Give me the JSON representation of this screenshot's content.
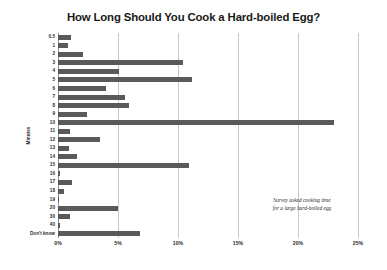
{
  "chart_data": {
    "type": "bar",
    "orientation": "horizontal",
    "title": "How Long Should You Cook a Hard-boiled Egg?",
    "xlabel": "",
    "ylabel": "Minutes",
    "categories": [
      "0.5",
      "1",
      "2",
      "3",
      "4",
      "5",
      "6",
      "7",
      "8",
      "9",
      "10",
      "11",
      "12",
      "13",
      "14",
      "15",
      "16",
      "17",
      "18",
      "19",
      "20",
      "30",
      "40",
      "Don't know"
    ],
    "values": [
      1.1,
      0.8,
      2.1,
      10.4,
      5.1,
      11.2,
      4.0,
      5.6,
      5.9,
      2.4,
      23.0,
      1.0,
      3.5,
      0.9,
      1.6,
      10.9,
      0.2,
      1.2,
      0.5,
      0.1,
      5.0,
      1.0,
      0.2,
      6.8
    ],
    "xlim": [
      0,
      25
    ],
    "xticks": [
      0,
      5,
      10,
      15,
      20,
      25
    ],
    "xtick_labels": [
      "0%",
      "5%",
      "10%",
      "15%",
      "20%",
      "25%"
    ],
    "grid": true,
    "legend": false,
    "bar_color": "#5a5a5a",
    "grid_color": "#c9c9c9",
    "annotation": {
      "line1": "Survey asked cooking time",
      "line2": "for a large hard-boiled egg"
    }
  }
}
